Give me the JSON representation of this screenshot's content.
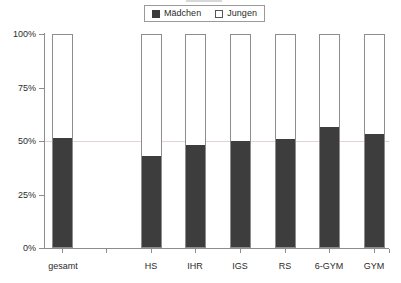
{
  "legend": {
    "entries": [
      {
        "label": "Mädchen",
        "swatch": "filled-square-icon",
        "color": "#3d3d3d"
      },
      {
        "label": "Jungen",
        "swatch": "hollow-square-icon",
        "color": "#ffffff"
      }
    ]
  },
  "axes": {
    "y_ticks": [
      "100%",
      "75%",
      "50%",
      "25%",
      "0%"
    ],
    "x_ticks": [
      "gesamt",
      "HS",
      "IHR",
      "IGS",
      "RS",
      "6-GYM",
      "GYM"
    ]
  },
  "colors": {
    "maedchen": "#3d3d3d",
    "jungen": "#ffffff",
    "axis": "#8d8d8d",
    "gridline": "#e3d3d3",
    "text": "#2b2b2b"
  },
  "chart_data": {
    "type": "bar",
    "subtype": "stacked-100-percent",
    "title": "",
    "subtitle": "",
    "xlabel": "",
    "ylabel": "",
    "ylim": [
      0,
      100
    ],
    "yticks": [
      0,
      25,
      50,
      75,
      100
    ],
    "ytick_labels": [
      "0%",
      "25%",
      "50%",
      "75%",
      "100%"
    ],
    "grid": true,
    "gridlines_at": [
      50
    ],
    "legend_position": "top-center",
    "categories": [
      "gesamt",
      "HS",
      "IHR",
      "IGS",
      "RS",
      "6-GYM",
      "GYM"
    ],
    "series": [
      {
        "name": "Mädchen",
        "color": "#3d3d3d",
        "values": [
          51,
          42.5,
          47.5,
          49.5,
          50.5,
          56,
          53
        ]
      },
      {
        "name": "Jungen",
        "color": "#ffffff",
        "values": [
          49,
          57.5,
          52.5,
          50.5,
          49.5,
          44,
          47
        ]
      }
    ]
  },
  "layout": {
    "bars": [
      {
        "key": "gesamt",
        "left": 52,
        "width": 21,
        "tick": 62,
        "label_left": 40,
        "label_width": 46
      },
      {
        "key": "HS",
        "left": 141,
        "width": 21,
        "tick": 151,
        "label_left": 128,
        "label_width": 46
      },
      {
        "key": "IHR",
        "left": 185,
        "width": 21,
        "tick": 195,
        "label_left": 172,
        "label_width": 46
      },
      {
        "key": "IGS",
        "left": 230,
        "width": 21,
        "tick": 240,
        "label_left": 217,
        "label_width": 46
      },
      {
        "key": "RS",
        "left": 275,
        "width": 21,
        "tick": 285,
        "label_left": 262,
        "label_width": 46
      },
      {
        "key": "6-GYM",
        "left": 319,
        "width": 21,
        "tick": 329,
        "label_left": 306,
        "label_width": 46
      },
      {
        "key": "GYM",
        "left": 364,
        "width": 21,
        "tick": 374,
        "label_left": 351,
        "label_width": 46
      }
    ],
    "extra_xticks": [
      106,
      374,
      389
    ],
    "y_top_px": 34,
    "y_bottom_px": 248
  }
}
